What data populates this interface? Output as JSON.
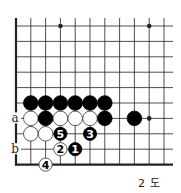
{
  "diagram": {
    "caption": "2 도",
    "grid": {
      "x0": 16,
      "y0": 26,
      "dx": 14.8,
      "dy": 15.4,
      "cols": 11,
      "rows": 10,
      "right_end": 173,
      "top_start": 18,
      "left_edge": true,
      "bottom_edge": true
    },
    "star_points": [
      [
        3,
        0
      ],
      [
        9,
        0
      ],
      [
        9,
        6
      ]
    ],
    "stones": [
      {
        "col": 1,
        "row": 5,
        "color": "black"
      },
      {
        "col": 2,
        "row": 5,
        "color": "black"
      },
      {
        "col": 3,
        "row": 5,
        "color": "black"
      },
      {
        "col": 4,
        "row": 5,
        "color": "black"
      },
      {
        "col": 5,
        "row": 5,
        "color": "black"
      },
      {
        "col": 6,
        "row": 5,
        "color": "black"
      },
      {
        "col": 1,
        "row": 6,
        "color": "white"
      },
      {
        "col": 2,
        "row": 6,
        "color": "black"
      },
      {
        "col": 3,
        "row": 6,
        "color": "white"
      },
      {
        "col": 4,
        "row": 6,
        "color": "white"
      },
      {
        "col": 5,
        "row": 6,
        "color": "white"
      },
      {
        "col": 6,
        "row": 6,
        "color": "black"
      },
      {
        "col": 8,
        "row": 6,
        "color": "black"
      },
      {
        "col": 1,
        "row": 7,
        "color": "white"
      },
      {
        "col": 2,
        "row": 7,
        "color": "white"
      },
      {
        "col": 3,
        "row": 7,
        "color": "black",
        "label": "5"
      },
      {
        "col": 5,
        "row": 7,
        "color": "black",
        "label": "3"
      },
      {
        "col": 3,
        "row": 8,
        "color": "white",
        "label": "2"
      },
      {
        "col": 4,
        "row": 8,
        "color": "black",
        "label": "1"
      },
      {
        "col": 2,
        "row": 9,
        "color": "white",
        "label": "4"
      }
    ],
    "markers": [
      {
        "label": "a",
        "col": 0,
        "row": 6
      },
      {
        "label": "b",
        "col": 0,
        "row": 8
      }
    ],
    "colors": {
      "line": "#222222",
      "black": "#000000",
      "white": "#ffffff",
      "text": "#222222"
    }
  }
}
